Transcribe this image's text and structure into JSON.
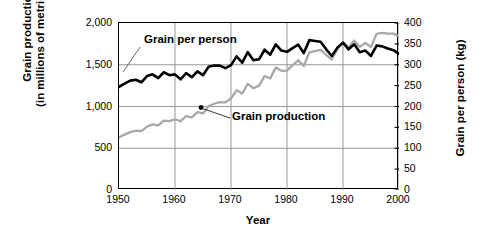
{
  "figure": {
    "title_clipped": "",
    "axis_left_title_line1": "Grain production",
    "axis_left_title_line2": "(in millions of metric tons)",
    "axis_right_title": "Grain per person (kg)",
    "axis_x_title": "Year",
    "annotation_grain_per_person": "Grain per person",
    "annotation_grain_production": "Grain production",
    "color_production_line": "#a8a8a8",
    "color_per_person_line": "#000000",
    "color_grid": "#8c8c8c",
    "color_frame": "#000000"
  },
  "chart_data": {
    "type": "line",
    "title": "",
    "xlabel": "Year",
    "ylabel": "Grain production (in millions of metric tons)",
    "y2label": "Grain per person (kg)",
    "xlim": [
      1950,
      2000
    ],
    "ylim": [
      0,
      2000
    ],
    "y2lim": [
      0,
      400
    ],
    "xticks": [
      1950,
      1960,
      1970,
      1980,
      1990,
      2000
    ],
    "xticklabels": [
      "1950",
      "1960",
      "1970",
      "1980",
      "1990",
      "2000"
    ],
    "yticks": [
      0,
      500,
      1000,
      1500,
      2000
    ],
    "yticklabels": [
      "0",
      "500",
      "1,000",
      "1,500",
      "2,000"
    ],
    "y2ticks": [
      0,
      50,
      100,
      150,
      200,
      250,
      300,
      350,
      400
    ],
    "y2ticklabels": [
      "0",
      "50",
      "100",
      "150",
      "200",
      "250",
      "300",
      "350",
      "400"
    ],
    "grid": true,
    "grid_x_at": [
      1960,
      1970,
      1980,
      1990,
      2000
    ],
    "grid_y_at": [
      500,
      1000,
      1500
    ],
    "legend": "annotations-inline",
    "x": [
      1950,
      1951,
      1952,
      1953,
      1954,
      1955,
      1956,
      1957,
      1958,
      1959,
      1960,
      1961,
      1962,
      1963,
      1964,
      1965,
      1966,
      1967,
      1968,
      1969,
      1970,
      1971,
      1972,
      1973,
      1974,
      1975,
      1976,
      1977,
      1978,
      1979,
      1980,
      1981,
      1982,
      1983,
      1984,
      1985,
      1986,
      1987,
      1988,
      1989,
      1990,
      1991,
      1992,
      1993,
      1994,
      1995,
      1996,
      1997,
      1998,
      1999,
      2000
    ],
    "series": [
      {
        "name": "Grain production",
        "axis": "left",
        "unit": "million metric tons",
        "color": "#a8a8a8",
        "values": [
          631,
          663,
          693,
          711,
          706,
          760,
          785,
          775,
          830,
          824,
          847,
          824,
          886,
          869,
          932,
          917,
          1005,
          1033,
          1052,
          1049,
          1096,
          1194,
          1156,
          1272,
          1219,
          1250,
          1363,
          1337,
          1467,
          1427,
          1430,
          1496,
          1553,
          1486,
          1649,
          1664,
          1679,
          1617,
          1562,
          1685,
          1769,
          1709,
          1790,
          1714,
          1760,
          1712,
          1871,
          1881,
          1873,
          1873,
          1840
        ]
      },
      {
        "name": "Grain per person",
        "axis": "right",
        "unit": "kg",
        "color": "#000000",
        "values": [
          247,
          255,
          262,
          264,
          258,
          273,
          277,
          268,
          282,
          275,
          277,
          265,
          280,
          270,
          284,
          275,
          295,
          298,
          298,
          292,
          299,
          320,
          305,
          330,
          311,
          313,
          336,
          324,
          349,
          334,
          331,
          340,
          348,
          328,
          359,
          357,
          355,
          337,
          321,
          341,
          353,
          337,
          349,
          330,
          334,
          321,
          346,
          344,
          339,
          335,
          326
        ]
      }
    ]
  }
}
